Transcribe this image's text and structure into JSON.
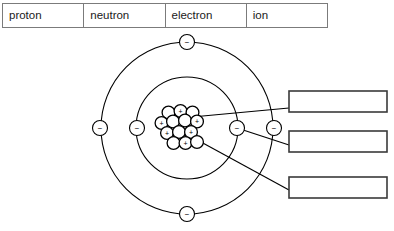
{
  "word_bank": {
    "name": "word-bank-table",
    "cells": [
      {
        "label": "proton"
      },
      {
        "label": "neutron"
      },
      {
        "label": "electron"
      },
      {
        "label": "ion"
      }
    ]
  },
  "diagram": {
    "colors": {
      "stroke": "#000000",
      "table_border": "#7b7b7b",
      "box_border": "#3a3a3a",
      "fill": "#ffffff"
    },
    "nucleus": {
      "name": "nucleus-cluster",
      "center": {
        "x": 181,
        "y": 124
      },
      "particle_radius": 6.4,
      "proton_count": 7,
      "neutron_count": 6,
      "proton_symbol": "+",
      "neutron_symbol": "",
      "particles": [
        {
          "type": "neutron",
          "x": 168.5,
          "y": 112.5,
          "symbol": ""
        },
        {
          "type": "proton",
          "x": 180.5,
          "y": 111.0,
          "symbol": "+"
        },
        {
          "type": "neutron",
          "x": 192.5,
          "y": 112.5,
          "symbol": ""
        },
        {
          "type": "proton",
          "x": 161.5,
          "y": 123.0,
          "symbol": "+"
        },
        {
          "type": "neutron",
          "x": 173.0,
          "y": 121.5,
          "symbol": ""
        },
        {
          "type": "neutron",
          "x": 185.0,
          "y": 120.5,
          "symbol": ""
        },
        {
          "type": "proton",
          "x": 197.0,
          "y": 121.5,
          "symbol": "+"
        },
        {
          "type": "proton",
          "x": 167.0,
          "y": 133.0,
          "symbol": "+"
        },
        {
          "type": "neutron",
          "x": 179.0,
          "y": 132.0,
          "symbol": ""
        },
        {
          "type": "proton",
          "x": 191.0,
          "y": 132.0,
          "symbol": "+"
        },
        {
          "type": "neutron",
          "x": 173.5,
          "y": 143.0,
          "symbol": ""
        },
        {
          "type": "proton",
          "x": 185.5,
          "y": 143.0,
          "symbol": "+"
        },
        {
          "type": "neutron",
          "x": 197.0,
          "y": 142.0,
          "symbol": ""
        }
      ]
    },
    "shells": [
      {
        "name": "inner-shell",
        "cx": 187,
        "cy": 128,
        "r": 51
      },
      {
        "name": "outer-shell",
        "cx": 187,
        "cy": 128,
        "r": 86
      }
    ],
    "electrons": [
      {
        "name": "electron-outer-top",
        "x": 187,
        "y": 42,
        "r": 7.5,
        "symbol": "−",
        "shell": "outer"
      },
      {
        "name": "electron-outer-left",
        "x": 100,
        "y": 128,
        "r": 7.5,
        "symbol": "−",
        "shell": "outer"
      },
      {
        "name": "electron-outer-right",
        "x": 274,
        "y": 128,
        "r": 7.5,
        "symbol": "−",
        "shell": "outer"
      },
      {
        "name": "electron-outer-bottom",
        "x": 187,
        "y": 214,
        "r": 7.5,
        "symbol": "−",
        "shell": "outer"
      },
      {
        "name": "electron-inner-left",
        "x": 137,
        "y": 128,
        "r": 7.5,
        "symbol": "−",
        "shell": "inner"
      },
      {
        "name": "electron-inner-right",
        "x": 237,
        "y": 128,
        "r": 7.5,
        "symbol": "−",
        "shell": "inner"
      }
    ],
    "leader_lines": [
      {
        "name": "leader-line-to-box-1",
        "x1": 192,
        "y1": 117,
        "x2": 289,
        "y2": 108,
        "source": "nucleus-proton"
      },
      {
        "name": "leader-line-to-box-2",
        "x1": 237,
        "y1": 128,
        "x2": 289,
        "y2": 145,
        "source": "electron-inner-right"
      },
      {
        "name": "leader-line-to-box-3",
        "x1": 190,
        "y1": 136,
        "x2": 289,
        "y2": 190,
        "source": "nucleus-neutron"
      }
    ],
    "answer_boxes": [
      {
        "name": "answer-box-1",
        "x": 289,
        "y": 91,
        "width": 98,
        "height": 21,
        "value": "",
        "placeholder": ""
      },
      {
        "name": "answer-box-2",
        "x": 289,
        "y": 131,
        "width": 98,
        "height": 21,
        "value": "",
        "placeholder": ""
      },
      {
        "name": "answer-box-3",
        "x": 289,
        "y": 177,
        "width": 98,
        "height": 21,
        "value": "",
        "placeholder": ""
      }
    ]
  }
}
